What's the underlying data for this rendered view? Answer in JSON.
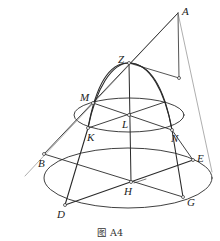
{
  "figure": {
    "caption": "图  A4",
    "colors": {
      "stroke": "#2a2a2a",
      "thin": "#555555",
      "background": "#ffffff"
    },
    "points": [
      {
        "id": "A",
        "label": "A",
        "x": 178,
        "y": 13,
        "lx": 182,
        "ly": 15
      },
      {
        "id": "Z",
        "label": "Z",
        "x": 129,
        "y": 63,
        "lx": 118,
        "ly": 63
      },
      {
        "id": "M",
        "label": "M",
        "x": 93,
        "y": 103,
        "lx": 80,
        "ly": 101
      },
      {
        "id": "K",
        "label": "K",
        "x": 88,
        "y": 128,
        "lx": 87,
        "ly": 141
      },
      {
        "id": "L",
        "label": "L",
        "x": 129,
        "y": 115,
        "lx": 122,
        "ly": 128
      },
      {
        "id": "N",
        "label": "N",
        "x": 172,
        "y": 130,
        "lx": 171,
        "ly": 142
      },
      {
        "id": "B",
        "label": "B",
        "x": 44,
        "y": 154,
        "lx": 38,
        "ly": 167
      },
      {
        "id": "E",
        "label": "E",
        "x": 193,
        "y": 160,
        "lx": 197,
        "ly": 162
      },
      {
        "id": "H",
        "label": "H",
        "x": 131,
        "y": 182,
        "lx": 124,
        "ly": 195
      },
      {
        "id": "D",
        "label": "D",
        "x": 65,
        "y": 205,
        "lx": 57,
        "ly": 218
      },
      {
        "id": "G",
        "label": "G",
        "x": 183,
        "y": 197,
        "lx": 187,
        "ly": 206
      }
    ]
  }
}
